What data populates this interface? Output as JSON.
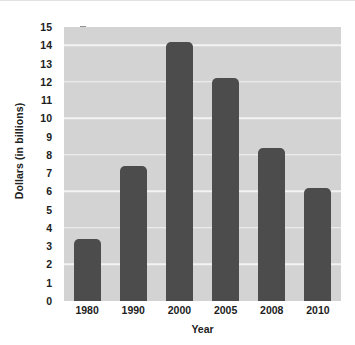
{
  "chart_data": {
    "type": "bar",
    "title": "",
    "xlabel": "Year",
    "ylabel": "Dollars (in billions)",
    "categories": [
      "1980",
      "1990",
      "2000",
      "2005",
      "2008",
      "2010"
    ],
    "values": [
      3.4,
      7.4,
      14.2,
      12.2,
      8.4,
      6.2
    ],
    "series": [
      {
        "name": "Dollars (in billions)",
        "values": [
          3.4,
          7.4,
          14.2,
          12.2,
          8.4,
          6.2
        ]
      }
    ],
    "ylim": [
      0,
      15
    ],
    "y_tick_labels": [
      "0",
      "1",
      "2",
      "3",
      "4",
      "5",
      "6",
      "7",
      "8",
      "9",
      "10",
      "11",
      "12",
      "13",
      "14",
      "15"
    ],
    "y_tick_values": [
      0,
      1,
      2,
      3,
      4,
      5,
      6,
      7,
      8,
      9,
      10,
      11,
      12,
      13,
      14,
      15
    ],
    "y_tick_step": 1,
    "gridline_values": [
      2,
      4,
      6,
      8,
      10,
      12,
      14
    ],
    "grid": true,
    "legend": "none",
    "colors": {
      "bar": "#4c4c4c",
      "plot_background": "#d3d3d3",
      "gridline": "#f3f3f3",
      "figure_background": "#ffffff",
      "text": "#1d1d1d",
      "tick_mark": "#6d6d6d"
    }
  }
}
